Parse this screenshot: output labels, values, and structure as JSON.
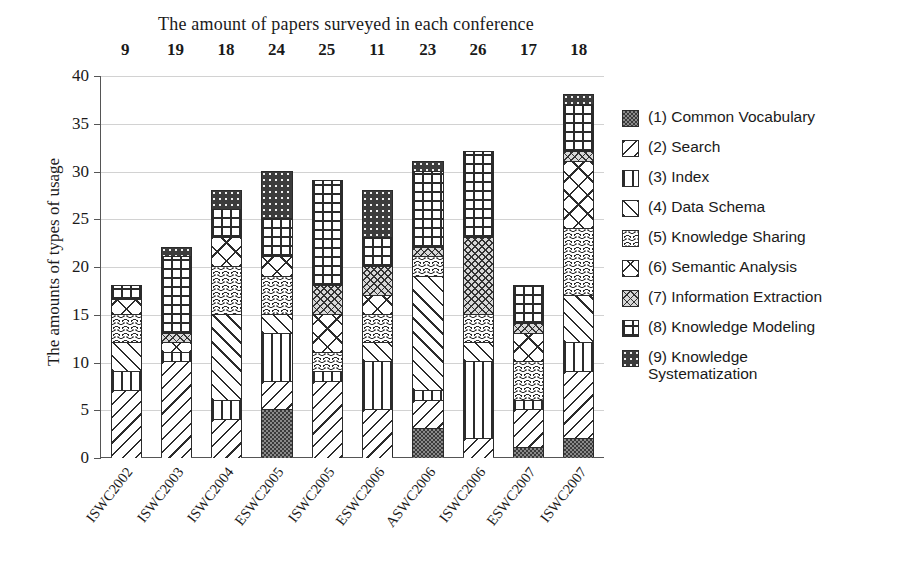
{
  "chart_data": {
    "type": "bar",
    "subtype": "stacked-bar",
    "title": "The amount of papers surveyed in each conference",
    "xlabel": "",
    "ylabel": "The amounts of types of usage",
    "ylim": [
      0,
      40
    ],
    "yticks": [
      0,
      5,
      10,
      15,
      20,
      25,
      30,
      35,
      40
    ],
    "grid": true,
    "legend_position": "right",
    "categories": [
      "ISWC2002",
      "ISWC2003",
      "ISWC2004",
      "ESWC2005",
      "ISWC2005",
      "ESWC2006",
      "ASWC2006",
      "ISWC2006",
      "ESWC2007",
      "ISWC2007"
    ],
    "papers_surveyed": [
      9,
      19,
      18,
      24,
      25,
      11,
      23,
      26,
      17,
      18
    ],
    "series": [
      {
        "name": "(1) Common Vocabulary",
        "key": "p1",
        "values": [
          0,
          0,
          0,
          5,
          0,
          0,
          3,
          0,
          1,
          2
        ]
      },
      {
        "name": "(2) Search",
        "key": "p2",
        "values": [
          7,
          10,
          4,
          3,
          8,
          5,
          3,
          2,
          4,
          7
        ]
      },
      {
        "name": "(3) Index",
        "key": "p3",
        "values": [
          2,
          1,
          2,
          5,
          1,
          5,
          1,
          8,
          1,
          3
        ]
      },
      {
        "name": "(4) Data Schema",
        "key": "p4",
        "values": [
          3,
          0,
          9,
          2,
          0,
          2,
          12,
          2,
          0,
          5
        ]
      },
      {
        "name": "(5) Knowledge Sharing",
        "key": "p5",
        "values": [
          3,
          0,
          5,
          4,
          2,
          3,
          2,
          3,
          4,
          7
        ]
      },
      {
        "name": "(6) Semantic Analysis",
        "key": "p6",
        "values": [
          1.5,
          1,
          3,
          2,
          4,
          2,
          0,
          0,
          3,
          7
        ]
      },
      {
        "name": "(7) Information Extraction",
        "key": "p7",
        "values": [
          0,
          1,
          0,
          0,
          3,
          3,
          1,
          8,
          1,
          1
        ]
      },
      {
        "name": "(8) Knowledge Modeling",
        "key": "p8",
        "values": [
          1.5,
          8,
          3,
          4,
          11,
          3,
          8,
          9,
          4,
          5
        ]
      },
      {
        "name": "(9) Knowledge Systematization",
        "key": "p9",
        "values": [
          0,
          1,
          2,
          5,
          0,
          5,
          1,
          0,
          0,
          1
        ]
      }
    ],
    "totals": [
      18,
      22,
      28,
      30,
      29,
      28,
      31,
      32,
      18,
      38
    ]
  },
  "legend": {
    "items": [
      {
        "label": "(1) Common Vocabulary",
        "key": "p1"
      },
      {
        "label": "(2) Search",
        "key": "p2"
      },
      {
        "label": "(3) Index",
        "key": "p3"
      },
      {
        "label": "(4) Data Schema",
        "key": "p4"
      },
      {
        "label": "(5) Knowledge Sharing",
        "key": "p5"
      },
      {
        "label": "(6) Semantic Analysis",
        "key": "p6"
      },
      {
        "label": "(7) Information Extraction",
        "key": "p7"
      },
      {
        "label": "(8) Knowledge Modeling",
        "key": "p8"
      },
      {
        "label": "(9) Knowledge\nSystematization",
        "key": "p9"
      }
    ]
  }
}
